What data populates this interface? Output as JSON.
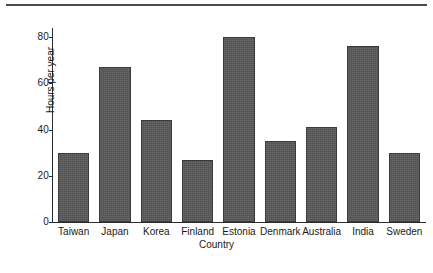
{
  "figure": {
    "background_color": "#ffffff",
    "rule_color": "#4a4a4a",
    "bar_color": "#595959",
    "bar_edge_color": "#3a3a3a",
    "axis_color": "#2b2b2b"
  },
  "chart_data": {
    "type": "bar",
    "title": "",
    "subtitle": "",
    "xlabel": "Country",
    "ylabel": "Hours per year",
    "categories": [
      "Taiwan",
      "Japan",
      "Korea",
      "Finland",
      "Estonia",
      "Denmark",
      "Australia",
      "India",
      "Sweden"
    ],
    "values": [
      30,
      67,
      44,
      27,
      80,
      35,
      41,
      76,
      30
    ],
    "ylim": [
      0,
      84
    ],
    "yticks": [
      0,
      20,
      40,
      60,
      80
    ],
    "ytick_labels": [
      "0",
      "20",
      "40",
      "60",
      "80"
    ],
    "grid": false,
    "legend": null,
    "annotations": []
  }
}
